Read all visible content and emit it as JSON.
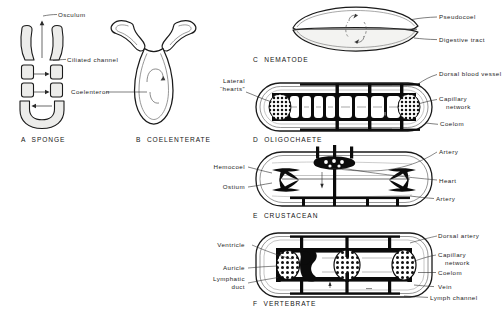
{
  "figure": {
    "colors": {
      "ink": "#1a1a1a",
      "background": "#ffffff",
      "tissue_fill": "#ededea",
      "vessel_fill": "#000000",
      "light_fill": "#f7f7f5"
    }
  },
  "panels": [
    {
      "id": "a",
      "caption": "A  SPONGE",
      "labels": [
        {
          "text": "Osculum"
        },
        {
          "text": "Ciliated channel"
        }
      ]
    },
    {
      "id": "b",
      "caption": "B  COELENTERATE",
      "labels": [
        {
          "text": "Coelenteron"
        }
      ]
    },
    {
      "id": "c",
      "caption": "C  NEMATODE",
      "labels": [
        {
          "text": "Pseudocoel"
        },
        {
          "text": "Digestive tract"
        }
      ]
    },
    {
      "id": "d",
      "caption": "D  OLIGOCHAETE",
      "labels": [
        {
          "text": "Lateral"
        },
        {
          "text": "“hearts”"
        },
        {
          "text": "Dorsal blood vessel"
        },
        {
          "text": "Capillary"
        },
        {
          "text": "network"
        },
        {
          "text": "Coelom"
        }
      ]
    },
    {
      "id": "e",
      "caption": "E  CRUSTACEAN",
      "labels": [
        {
          "text": "Hemocoel"
        },
        {
          "text": "Ostium"
        },
        {
          "text": "Artery"
        },
        {
          "text": "Heart"
        },
        {
          "text": "Artery"
        }
      ]
    },
    {
      "id": "f",
      "caption": "F  VERTEBRATE",
      "labels": [
        {
          "text": "Ventricle"
        },
        {
          "text": "Auricle"
        },
        {
          "text": "Lymphatic"
        },
        {
          "text": "duct"
        },
        {
          "text": "Dorsal artery"
        },
        {
          "text": "Capillary"
        },
        {
          "text": "network"
        },
        {
          "text": "Coelom"
        },
        {
          "text": "Vein"
        },
        {
          "text": "Lymph channel"
        }
      ]
    }
  ]
}
